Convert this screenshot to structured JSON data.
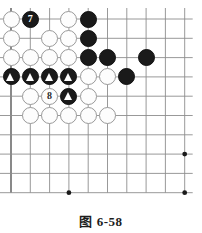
{
  "figure": {
    "caption": "图 6-58",
    "caption_label": "图",
    "caption_number": "6-58"
  },
  "board": {
    "columns": 10,
    "rows": 10,
    "origin_x": 11,
    "origin_y": 19,
    "spacing": 19.3,
    "line_color": "#4a4a4a",
    "line_color_light": "#8d8d8d",
    "background_color": "#ffffff",
    "black_color": "#1a1a1a",
    "white_color": "#fdfdfd",
    "white_border_color": "#9a9a9a",
    "star_points": [
      {
        "col": 4,
        "row": 10
      },
      {
        "col": 10,
        "row": 8
      },
      {
        "col": 10,
        "row": 10
      }
    ]
  },
  "chart_data": {
    "type": "diagram",
    "title": "图 6-58",
    "grid": {
      "cols": 10,
      "rows": 10
    },
    "stones": [
      {
        "col": 1,
        "row": 1,
        "color": "white",
        "label": "",
        "marker": ""
      },
      {
        "col": 2,
        "row": 1,
        "color": "black",
        "label": "7",
        "marker": ""
      },
      {
        "col": 4,
        "row": 1,
        "color": "white",
        "label": "",
        "marker": ""
      },
      {
        "col": 5,
        "row": 1,
        "color": "black",
        "label": "",
        "marker": ""
      },
      {
        "col": 1,
        "row": 2,
        "color": "white",
        "label": "",
        "marker": ""
      },
      {
        "col": 3,
        "row": 2,
        "color": "white",
        "label": "",
        "marker": ""
      },
      {
        "col": 4,
        "row": 2,
        "color": "white",
        "label": "",
        "marker": ""
      },
      {
        "col": 5,
        "row": 2,
        "color": "black",
        "label": "",
        "marker": ""
      },
      {
        "col": 1,
        "row": 3,
        "color": "white",
        "label": "",
        "marker": ""
      },
      {
        "col": 2,
        "row": 3,
        "color": "white",
        "label": "",
        "marker": ""
      },
      {
        "col": 3,
        "row": 3,
        "color": "white",
        "label": "",
        "marker": ""
      },
      {
        "col": 4,
        "row": 3,
        "color": "white",
        "label": "",
        "marker": ""
      },
      {
        "col": 5,
        "row": 3,
        "color": "black",
        "label": "",
        "marker": ""
      },
      {
        "col": 6,
        "row": 3,
        "color": "black",
        "label": "",
        "marker": ""
      },
      {
        "col": 8,
        "row": 3,
        "color": "black",
        "label": "",
        "marker": ""
      },
      {
        "col": 1,
        "row": 4,
        "color": "black",
        "label": "",
        "marker": "triangle"
      },
      {
        "col": 2,
        "row": 4,
        "color": "black",
        "label": "",
        "marker": "triangle"
      },
      {
        "col": 3,
        "row": 4,
        "color": "black",
        "label": "",
        "marker": "triangle"
      },
      {
        "col": 4,
        "row": 4,
        "color": "black",
        "label": "",
        "marker": "triangle"
      },
      {
        "col": 5,
        "row": 4,
        "color": "white",
        "label": "",
        "marker": ""
      },
      {
        "col": 6,
        "row": 4,
        "color": "white",
        "label": "",
        "marker": ""
      },
      {
        "col": 7,
        "row": 4,
        "color": "black",
        "label": "",
        "marker": ""
      },
      {
        "col": 2,
        "row": 5,
        "color": "white",
        "label": "",
        "marker": ""
      },
      {
        "col": 3,
        "row": 5,
        "color": "white",
        "label": "8",
        "marker": ""
      },
      {
        "col": 4,
        "row": 5,
        "color": "black",
        "label": "",
        "marker": "triangle"
      },
      {
        "col": 5,
        "row": 5,
        "color": "white",
        "label": "",
        "marker": ""
      },
      {
        "col": 2,
        "row": 6,
        "color": "white",
        "label": "",
        "marker": ""
      },
      {
        "col": 3,
        "row": 6,
        "color": "white",
        "label": "",
        "marker": ""
      },
      {
        "col": 4,
        "row": 6,
        "color": "white",
        "label": "",
        "marker": ""
      },
      {
        "col": 5,
        "row": 6,
        "color": "white",
        "label": "",
        "marker": ""
      },
      {
        "col": 6,
        "row": 6,
        "color": "white",
        "label": "",
        "marker": ""
      }
    ],
    "move_numbers": [
      {
        "number": "7",
        "color": "black",
        "col": 2,
        "row": 1
      },
      {
        "number": "8",
        "color": "white",
        "col": 3,
        "row": 5
      }
    ],
    "marked_stones_note": "triangle-marked black stones"
  }
}
